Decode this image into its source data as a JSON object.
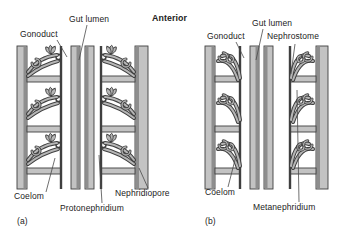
{
  "figure": {
    "anterior_label": "Anterior"
  },
  "panel_a": {
    "tag": "(a)",
    "gut_lumen": "Gut lumen",
    "gonoduct": "Gonoduct",
    "coelom": "Coelom",
    "protonephridium": "Protonephridium",
    "nephridiopore": "Nephridiopore"
  },
  "panel_b": {
    "tag": "(b)",
    "gut_lumen": "Gut lumen",
    "gonoduct": "Gonoduct",
    "nephrostome": "Nephrostome",
    "coelom": "Coelom",
    "metanephridium": "Metanephridium"
  },
  "colors": {
    "background": "#ffffff",
    "text": "#222222",
    "band_fill": "#c3c3c3",
    "band_edge": "#3f3f3f",
    "band_shade": "#8e8e8e",
    "tube_light": "#b6b6b6",
    "leader": "#4a4a4a"
  }
}
